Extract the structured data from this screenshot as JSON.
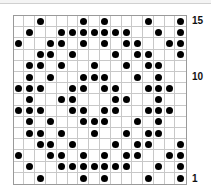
{
  "puzzle": {
    "columns": 16,
    "rows": 15,
    "row_labels": [
      {
        "row": 15,
        "text": "15"
      },
      {
        "row": 10,
        "text": "10"
      },
      {
        "row": 1,
        "text": "1"
      }
    ],
    "dot_color": "#000000",
    "grid_line_color": "#c8c8c8",
    "dots_by_row": {
      "15": [
        3,
        7,
        9,
        13,
        16
      ],
      "14": [
        2,
        5,
        6,
        7,
        8,
        9,
        10,
        11,
        14,
        16
      ],
      "13": [
        1,
        4,
        5,
        7,
        9,
        11,
        12,
        15,
        16
      ],
      "12": [
        3,
        4,
        6,
        10,
        12,
        13,
        16
      ],
      "11": [
        2,
        3,
        5,
        8,
        11,
        13,
        14
      ],
      "10": [
        2,
        4,
        7,
        8,
        9,
        12,
        14
      ],
      "9": [
        1,
        2,
        3,
        6,
        7,
        9,
        10,
        13,
        14,
        15
      ],
      "8": [
        2,
        5,
        6,
        10,
        11,
        14
      ],
      "7": [
        1,
        2,
        3,
        6,
        7,
        9,
        10,
        13,
        14,
        15
      ],
      "6": [
        2,
        4,
        7,
        8,
        9,
        12,
        14
      ],
      "5": [
        2,
        3,
        5,
        8,
        11,
        13,
        14
      ],
      "4": [
        3,
        4,
        6,
        10,
        12,
        13,
        16
      ],
      "3": [
        1,
        4,
        5,
        7,
        9,
        11,
        12,
        15,
        16
      ],
      "2": [
        2,
        5,
        6,
        7,
        8,
        9,
        10,
        11,
        14,
        16
      ],
      "1": [
        3,
        7,
        9,
        13,
        16
      ]
    }
  }
}
